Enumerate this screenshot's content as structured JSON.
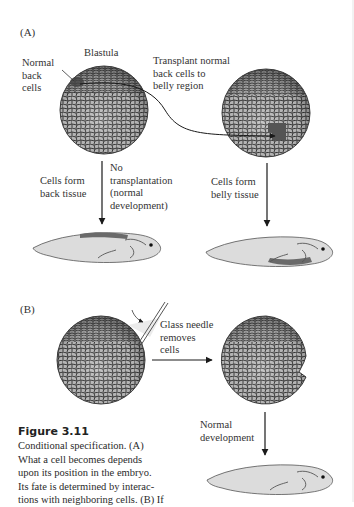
{
  "figure": {
    "number": "Figure 3.11",
    "caption_lines": [
      "Conditional specification. (A)",
      "What a cell becomes depends",
      "upon its position in the embryo.",
      "Its fate is determined by interac-",
      "tions with neighboring cells. (B) If"
    ]
  },
  "panel_a": {
    "label": "(A)",
    "blastula_label": "Blastula",
    "normal_back_cells_label": "Normal\nback\ncells",
    "transplant_label": "Transplant normal\nback cells to\nbelly region",
    "left_arrow_label": "Cells form\nback tissue",
    "no_transplant_label": "No\ntransplantation\n(normal\ndevelopment)",
    "right_arrow_label": "Cells form\nbelly tissue"
  },
  "panel_b": {
    "label": "(B)",
    "needle_label": "Glass needle\nremoves\ncells",
    "normal_dev_label": "Normal\ndevelopment"
  },
  "colors": {
    "sphere_fill": "#b9b9b9",
    "sphere_line": "#3a3a3a",
    "transplanted_cells": "#555555",
    "tadpole_fill": "#dcdcdc",
    "tadpole_dark": "#6a6a6a",
    "arrow": "#1a1a1a"
  }
}
